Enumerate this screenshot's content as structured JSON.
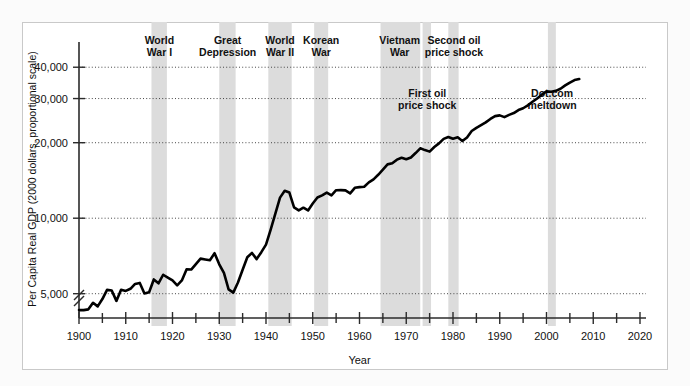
{
  "figure": {
    "background": "#fbfbfb",
    "plot_background": "#ffffff",
    "band_color": "#dcdcdc",
    "line_color": "#000000"
  },
  "chart_data": {
    "type": "line",
    "title": "",
    "xlabel": "Year",
    "ylabel": "Per Capita Real GDP (2000 dollars, proportional scale)",
    "yscale": "log",
    "xlim": [
      1900,
      2020
    ],
    "ylim": [
      4000,
      46000
    ],
    "grid": true,
    "legend": "none",
    "axis_break": true,
    "ytick_values": [
      5000,
      10000,
      20000,
      30000,
      40000
    ],
    "ytick_labels": [
      "5,000",
      "10,000",
      "20,000",
      "30,000",
      "40,000"
    ],
    "xtick_values": [
      1900,
      1910,
      1920,
      1930,
      1940,
      1950,
      1960,
      1970,
      1980,
      1990,
      2000,
      2010,
      2020
    ],
    "xtick_labels": [
      "1900",
      "1910",
      "1920",
      "1930",
      "1940",
      "1950",
      "1960",
      "1970",
      "1980",
      "1990",
      "2000",
      "2010",
      "2020"
    ],
    "xtick_minor": [
      1905,
      1915,
      1925,
      1935,
      1945,
      1955,
      1965,
      1975,
      1985,
      1995,
      2005,
      2015
    ],
    "series": [
      {
        "name": "Per Capita Real GDP",
        "x": [
          1900,
          1901,
          1902,
          1903,
          1904,
          1905,
          1906,
          1907,
          1908,
          1909,
          1910,
          1911,
          1912,
          1913,
          1914,
          1915,
          1916,
          1917,
          1918,
          1919,
          1920,
          1921,
          1922,
          1923,
          1924,
          1925,
          1926,
          1927,
          1928,
          1929,
          1930,
          1931,
          1932,
          1933,
          1934,
          1935,
          1936,
          1937,
          1938,
          1939,
          1940,
          1941,
          1942,
          1943,
          1944,
          1945,
          1946,
          1947,
          1948,
          1949,
          1950,
          1951,
          1952,
          1953,
          1954,
          1955,
          1956,
          1957,
          1958,
          1959,
          1960,
          1961,
          1962,
          1963,
          1964,
          1965,
          1966,
          1967,
          1968,
          1969,
          1970,
          1971,
          1972,
          1973,
          1974,
          1975,
          1976,
          1977,
          1978,
          1979,
          1980,
          1981,
          1982,
          1983,
          1984,
          1985,
          1986,
          1987,
          1988,
          1989,
          1990,
          1991,
          1992,
          1993,
          1994,
          1995,
          1996,
          1997,
          1998,
          1999,
          2000,
          2001,
          2002,
          2003,
          2004,
          2005,
          2006,
          2007
        ],
        "y": [
          4300,
          4300,
          4330,
          4600,
          4450,
          4760,
          5180,
          5150,
          4680,
          5180,
          5130,
          5230,
          5470,
          5520,
          5010,
          5070,
          5700,
          5500,
          5950,
          5800,
          5650,
          5400,
          5650,
          6250,
          6240,
          6560,
          6900,
          6850,
          6800,
          7250,
          6550,
          6050,
          5200,
          5050,
          5540,
          6230,
          6990,
          7270,
          6870,
          7320,
          7850,
          9010,
          10430,
          12080,
          12870,
          12660,
          11050,
          10750,
          11010,
          10740,
          11450,
          12090,
          12330,
          12660,
          12340,
          12930,
          12940,
          12910,
          12560,
          13220,
          13300,
          13350,
          13900,
          14290,
          14900,
          15610,
          16390,
          16550,
          17120,
          17430,
          17180,
          17470,
          18190,
          19000,
          18690,
          18430,
          19220,
          19880,
          20710,
          21090,
          20750,
          21010,
          20300,
          20980,
          22270,
          22930,
          23500,
          24100,
          24870,
          25530,
          25700,
          25300,
          25830,
          26260,
          26990,
          27440,
          28180,
          29110,
          30030,
          31090,
          32030,
          31940,
          32200,
          32840,
          33840,
          34740,
          35560,
          35900
        ]
      }
    ],
    "annotations": [
      {
        "label": "World\nWar I",
        "lines": [
          "World",
          "War I"
        ],
        "x_start": 1915.5,
        "x_end": 1918.8,
        "text_x": 1917.2,
        "text_y_px": 44
      },
      {
        "label": "Great\nDepression",
        "lines": [
          "Great",
          "Depression"
        ],
        "x_start": 1930.0,
        "x_end": 1933.5,
        "text_x": 1931.8,
        "text_y_px": 44
      },
      {
        "label": "World\nWar II",
        "lines": [
          "World",
          "War II"
        ],
        "x_start": 1940.5,
        "x_end": 1945.5,
        "text_x": 1943.0,
        "text_y_px": 44
      },
      {
        "label": "Korean\nWar",
        "lines": [
          "Korean",
          "War"
        ],
        "x_start": 1950.3,
        "x_end": 1953.3,
        "text_x": 1951.8,
        "text_y_px": 44
      },
      {
        "label": "Vietnam\nWar",
        "lines": [
          "Vietnam",
          "War"
        ],
        "x_start": 1964.5,
        "x_end": 1973.0,
        "text_x": 1968.6,
        "text_y_px": 44
      },
      {
        "label": "Second oil\nprice shock",
        "lines": [
          "Second oil",
          "price shock"
        ],
        "x_start": 1979.0,
        "x_end": 1981.2,
        "text_x": 1980.2,
        "text_y_px": 44
      },
      {
        "label": "First oil\nprice shock",
        "lines": [
          "First oil",
          "price shock"
        ],
        "x_start": 1973.5,
        "x_end": 1975.3,
        "text_x": 1974.5,
        "text_y_px": 97
      },
      {
        "label": "Dot.com\nmeltdown",
        "lines": [
          "Dot.com",
          "meltdown"
        ],
        "x_start": 2000.3,
        "x_end": 2002.0,
        "text_x": 2001.2,
        "text_y_px": 97
      }
    ]
  }
}
